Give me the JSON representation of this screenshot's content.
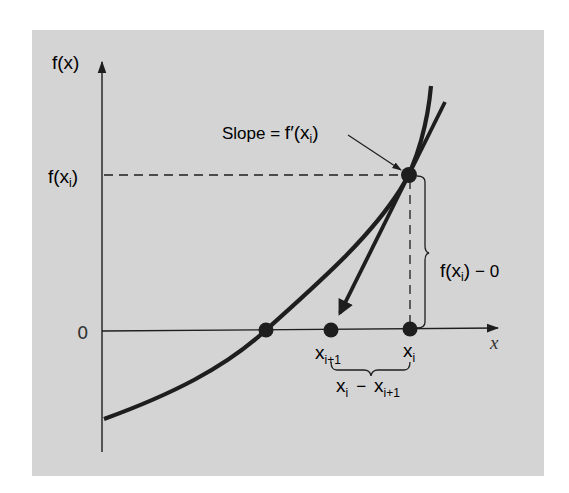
{
  "figure": {
    "background_color": "#ffffff",
    "panel_color": "#d4d4d4",
    "ink_color": "#1e1e1e",
    "text_color": "#333333"
  },
  "axes": {
    "y_label_f": "f",
    "y_label_paren": "(x)",
    "x_label": "x",
    "y_tick_zero": "0",
    "y_tick_fxi_f": "f",
    "y_tick_fxi_paren_open": "(x",
    "y_tick_fxi_sub": "i",
    "y_tick_fxi_paren_close": ")"
  },
  "annotations": {
    "slope_text": "Slope = ",
    "slope_f": "f",
    "slope_prime_paren": "′(x",
    "slope_sub": "i",
    "slope_close": ")",
    "height_f": "f",
    "height_paren": "(x",
    "height_sub": "i",
    "height_close": ")",
    "height_minus_zero": "− 0",
    "xi1_label": "x",
    "xi1_sub": "i+1",
    "xi_label": "x",
    "xi_sub": "i",
    "diff_xi": "x",
    "diff_xi_sub": "i",
    "diff_minus": "−",
    "diff_xi1": "x",
    "diff_xi1_sub": "i+1"
  },
  "points": [
    {
      "name": "root",
      "label": ""
    },
    {
      "name": "x_i_plus_1",
      "label": "x_{i+1}"
    },
    {
      "name": "x_i",
      "label": "x_i"
    },
    {
      "name": "f_x_i",
      "label": "f(x_i)"
    }
  ]
}
